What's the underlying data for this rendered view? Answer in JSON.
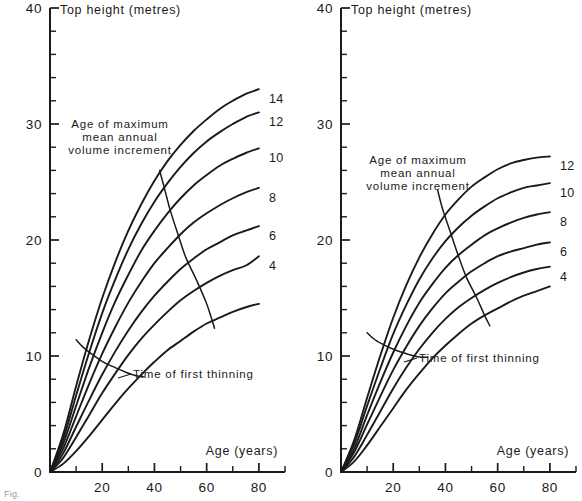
{
  "figure": {
    "caption_fragment": "Fig.",
    "background": "#ffffff",
    "ink": "#1a1a1a"
  },
  "chart_data": [
    {
      "type": "line",
      "panel": "left",
      "title": "Top height (metres)",
      "xlabel": "Age (years)",
      "ylabel": "Top height (metres)",
      "xlim": [
        0,
        90
      ],
      "ylim": [
        0,
        40
      ],
      "xticks": [
        0,
        10,
        20,
        30,
        40,
        50,
        60,
        70,
        80,
        90
      ],
      "xtick_labels": [
        "",
        "",
        "20",
        "",
        "40",
        "",
        "60",
        "",
        "80",
        ""
      ],
      "yticks": [
        0,
        2,
        4,
        6,
        8,
        10,
        12,
        14,
        16,
        18,
        20,
        22,
        24,
        26,
        28,
        30,
        32,
        34,
        36,
        38,
        40
      ],
      "ytick_labels": [
        "0",
        "",
        "",
        "",
        "",
        "10",
        "",
        "",
        "",
        "",
        "20",
        "",
        "",
        "",
        "",
        "30",
        "",
        "",
        "",
        "",
        "40"
      ],
      "grid": false,
      "legend_position": "inline-right-of-curve-ends",
      "series": [
        {
          "name": "14",
          "label": "14",
          "x": [
            0,
            5,
            10,
            15,
            20,
            25,
            30,
            35,
            40,
            45,
            50,
            55,
            60,
            65,
            70,
            75,
            80
          ],
          "values": [
            0,
            3.2,
            7.4,
            11.4,
            15.0,
            18.1,
            20.8,
            23.1,
            25.1,
            26.8,
            28.2,
            29.4,
            30.4,
            31.3,
            32.0,
            32.6,
            33.0
          ]
        },
        {
          "name": "12",
          "label": "12",
          "x": [
            0,
            5,
            10,
            15,
            20,
            25,
            30,
            35,
            40,
            45,
            50,
            55,
            60,
            65,
            70,
            75,
            80
          ],
          "values": [
            0,
            2.8,
            6.6,
            10.3,
            13.7,
            16.6,
            19.2,
            21.4,
            23.3,
            24.9,
            26.3,
            27.5,
            28.5,
            29.3,
            30.0,
            30.6,
            31.0
          ]
        },
        {
          "name": "10",
          "label": "10",
          "x": [
            0,
            5,
            10,
            15,
            20,
            25,
            30,
            35,
            40,
            45,
            50,
            55,
            60,
            65,
            70,
            75,
            80
          ],
          "values": [
            0,
            2.4,
            5.7,
            9.0,
            12.0,
            14.7,
            17.0,
            19.1,
            20.8,
            22.3,
            23.6,
            24.7,
            25.6,
            26.4,
            27.0,
            27.5,
            27.9
          ]
        },
        {
          "name": "8",
          "label": "8",
          "x": [
            0,
            5,
            10,
            15,
            20,
            25,
            30,
            35,
            40,
            45,
            50,
            55,
            60,
            65,
            70,
            75,
            80
          ],
          "values": [
            0,
            2.0,
            4.8,
            7.6,
            10.2,
            12.5,
            14.6,
            16.4,
            18.0,
            19.3,
            20.5,
            21.5,
            22.3,
            23.0,
            23.6,
            24.1,
            24.5
          ]
        },
        {
          "name": "6",
          "label": "6",
          "x": [
            0,
            5,
            10,
            15,
            20,
            25,
            30,
            35,
            40,
            45,
            50,
            55,
            60,
            65,
            70,
            75,
            80
          ],
          "values": [
            0,
            1.6,
            3.9,
            6.2,
            8.4,
            10.4,
            12.2,
            13.8,
            15.2,
            16.4,
            17.5,
            18.4,
            19.2,
            19.8,
            20.4,
            20.8,
            21.2
          ]
        },
        {
          "name": "4",
          "label": "4",
          "x": [
            0,
            5,
            10,
            15,
            20,
            25,
            30,
            35,
            40,
            45,
            50,
            55,
            60,
            65,
            70,
            75,
            80
          ],
          "values": [
            0,
            1.2,
            3.0,
            4.9,
            6.8,
            8.5,
            10.1,
            11.5,
            12.7,
            13.8,
            14.8,
            15.6,
            16.3,
            16.9,
            17.4,
            17.8,
            18.6
          ]
        },
        {
          "name": "lowest",
          "label": "",
          "x": [
            0,
            5,
            10,
            15,
            20,
            25,
            30,
            35,
            40,
            45,
            50,
            55,
            60,
            65,
            70,
            75,
            80
          ],
          "values": [
            0,
            0.7,
            1.8,
            3.1,
            4.5,
            5.9,
            7.2,
            8.4,
            9.5,
            10.5,
            11.3,
            12.1,
            12.8,
            13.3,
            13.8,
            14.2,
            14.5
          ]
        }
      ],
      "annotations": [
        {
          "id": "max-mai",
          "text_lines": [
            "Age of maximum",
            "mean annual",
            "volume increment"
          ],
          "leader_curve_x": [
            42,
            44,
            46,
            49,
            52,
            56,
            60,
            63
          ],
          "leader_curve_y": [
            26.0,
            24.3,
            22.6,
            20.5,
            18.5,
            16.6,
            14.5,
            12.4
          ]
        },
        {
          "id": "first-thinning",
          "text": "Time of first thinning",
          "curve_x": [
            10,
            13,
            17,
            21,
            25,
            29,
            33,
            36
          ],
          "curve_y": [
            11.4,
            10.7,
            10.0,
            9.4,
            9.0,
            8.6,
            8.3,
            8.2
          ]
        }
      ]
    },
    {
      "type": "line",
      "panel": "right",
      "title": "Top height (metres)",
      "xlabel": "Age (years)",
      "ylabel": "Top height (metres)",
      "xlim": [
        0,
        90
      ],
      "ylim": [
        0,
        40
      ],
      "xticks": [
        0,
        10,
        20,
        30,
        40,
        50,
        60,
        70,
        80,
        90
      ],
      "xtick_labels": [
        "",
        "",
        "20",
        "",
        "40",
        "",
        "60",
        "",
        "80",
        ""
      ],
      "yticks": [
        0,
        2,
        4,
        6,
        8,
        10,
        12,
        14,
        16,
        18,
        20,
        22,
        24,
        26,
        28,
        30,
        32,
        34,
        36,
        38,
        40
      ],
      "ytick_labels": [
        "0",
        "",
        "",
        "",
        "",
        "10",
        "",
        "",
        "",
        "",
        "20",
        "",
        "",
        "",
        "",
        "30",
        "",
        "",
        "",
        "",
        "40"
      ],
      "grid": false,
      "legend_position": "inline-right-of-curve-ends",
      "series": [
        {
          "name": "12",
          "label": "12",
          "x": [
            0,
            5,
            10,
            15,
            20,
            25,
            30,
            35,
            40,
            45,
            50,
            55,
            60,
            65,
            70,
            75,
            80
          ],
          "values": [
            0,
            2.7,
            6.4,
            10.0,
            13.3,
            16.1,
            18.5,
            20.5,
            22.2,
            23.5,
            24.6,
            25.4,
            26.1,
            26.6,
            26.9,
            27.1,
            27.2
          ]
        },
        {
          "name": "10",
          "label": "10",
          "x": [
            0,
            5,
            10,
            15,
            20,
            25,
            30,
            35,
            40,
            45,
            50,
            55,
            60,
            65,
            70,
            75,
            80
          ],
          "values": [
            0,
            2.4,
            5.7,
            8.9,
            11.9,
            14.4,
            16.6,
            18.4,
            19.9,
            21.1,
            22.1,
            22.9,
            23.6,
            24.1,
            24.5,
            24.7,
            24.9
          ]
        },
        {
          "name": "8",
          "label": "8",
          "x": [
            0,
            5,
            10,
            15,
            20,
            25,
            30,
            35,
            40,
            45,
            50,
            55,
            60,
            65,
            70,
            75,
            80
          ],
          "values": [
            0,
            2.0,
            4.9,
            7.7,
            10.3,
            12.6,
            14.6,
            16.2,
            17.6,
            18.7,
            19.6,
            20.4,
            21.0,
            21.5,
            21.9,
            22.2,
            22.4
          ]
        },
        {
          "name": "6",
          "label": "6",
          "x": [
            0,
            5,
            10,
            15,
            20,
            25,
            30,
            35,
            40,
            45,
            50,
            55,
            60,
            65,
            70,
            75,
            80
          ],
          "values": [
            0,
            1.7,
            4.1,
            6.5,
            8.8,
            10.8,
            12.6,
            14.1,
            15.4,
            16.4,
            17.3,
            18.0,
            18.6,
            19.0,
            19.3,
            19.6,
            19.8
          ]
        },
        {
          "name": "4",
          "label": "4",
          "x": [
            0,
            5,
            10,
            15,
            20,
            25,
            30,
            35,
            40,
            45,
            50,
            55,
            60,
            65,
            70,
            75,
            80
          ],
          "values": [
            0,
            1.3,
            3.2,
            5.2,
            7.2,
            9.0,
            10.6,
            12.0,
            13.2,
            14.2,
            15.0,
            15.7,
            16.3,
            16.8,
            17.2,
            17.5,
            17.7
          ]
        },
        {
          "name": "lowest",
          "label": "",
          "x": [
            0,
            5,
            10,
            15,
            20,
            25,
            30,
            35,
            40,
            45,
            50,
            55,
            60,
            65,
            70,
            75,
            80
          ],
          "values": [
            0,
            0.9,
            2.3,
            3.9,
            5.5,
            7.1,
            8.5,
            9.8,
            10.9,
            11.9,
            12.8,
            13.5,
            14.1,
            14.7,
            15.2,
            15.6,
            16.0
          ]
        }
      ],
      "annotations": [
        {
          "id": "max-mai",
          "text_lines": [
            "Age of maximum",
            "mean annual",
            "volume increment"
          ],
          "leader_curve_x": [
            37,
            39,
            42,
            45,
            48,
            52,
            55,
            57
          ],
          "leader_curve_y": [
            24.3,
            22.6,
            20.6,
            18.6,
            16.8,
            15.0,
            13.5,
            12.6
          ]
        },
        {
          "id": "first-thinning",
          "text": "Time of first thinning",
          "curve_x": [
            10,
            13,
            17,
            21,
            25,
            28,
            31,
            33
          ],
          "curve_y": [
            12.0,
            11.4,
            10.9,
            10.5,
            10.2,
            10.0,
            9.9,
            9.9
          ]
        }
      ]
    }
  ]
}
